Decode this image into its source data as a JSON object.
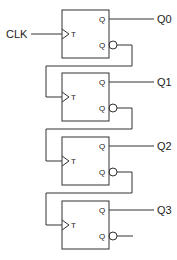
{
  "diagram": {
    "type": "circuit",
    "clock_label": "CLK",
    "flip_flops": [
      {
        "input_label": "T",
        "q_label": "Q",
        "qbar_label": "Q",
        "output_label": "Q0"
      },
      {
        "input_label": "T",
        "q_label": "Q",
        "qbar_label": "Q",
        "output_label": "Q1"
      },
      {
        "input_label": "T",
        "q_label": "Q",
        "qbar_label": "Q",
        "output_label": "Q2"
      },
      {
        "input_label": "T",
        "q_label": "Q",
        "qbar_label": "Q",
        "output_label": "Q3"
      }
    ],
    "connections": [
      "CLK -> FF0.T",
      "FF0.Qbar -> FF1.T",
      "FF1.Qbar -> FF2.T",
      "FF2.Qbar -> FF3.T"
    ]
  }
}
